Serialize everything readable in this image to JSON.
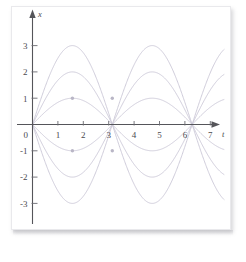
{
  "figure": {
    "background_color": "#ffffff",
    "plate_color": "#ffffff",
    "axis_color": "#55555a",
    "curve_color": "#c9c6d6",
    "marker_color": "#b9b6c6"
  },
  "chart_data": {
    "type": "line",
    "title": "",
    "subtitle": "",
    "xlabel": "t",
    "ylabel": "x",
    "xlim": [
      -0.55,
      7.8
    ],
    "ylim": [
      -3.9,
      3.9
    ],
    "grid": false,
    "legend": "none",
    "x_ticks": [
      0,
      1,
      2,
      3,
      4,
      5,
      6,
      7
    ],
    "x_tick_labels": [
      "0",
      "1",
      "2",
      "3",
      "4",
      "5",
      "6",
      "7"
    ],
    "y_ticks": [
      -3,
      -2,
      -1,
      1,
      2,
      3
    ],
    "y_tick_labels": [
      "-3",
      "-2",
      "-1",
      "1",
      "2",
      "3"
    ],
    "function_form": "x = A sin(t)",
    "period": 6.2832,
    "series": [
      {
        "name": "A = 3",
        "amplitude": 3,
        "values_at_peaks": [
          3,
          -3
        ]
      },
      {
        "name": "A = 2",
        "amplitude": 2,
        "values_at_peaks": [
          2,
          -2
        ]
      },
      {
        "name": "A = 1",
        "amplitude": 1,
        "values_at_peaks": [
          1,
          -1
        ]
      },
      {
        "name": "A = -1",
        "amplitude": -1,
        "values_at_peaks": [
          -1,
          1
        ]
      },
      {
        "name": "A = -2",
        "amplitude": -2,
        "values_at_peaks": [
          -2,
          2
        ]
      },
      {
        "name": "A = -3",
        "amplitude": -3,
        "values_at_peaks": [
          -3,
          3
        ]
      }
    ],
    "markers": [
      {
        "t": 1.5708,
        "x": 1
      },
      {
        "t": 1.5708,
        "x": -1
      },
      {
        "t": 3.1416,
        "x": 1
      },
      {
        "t": 3.1416,
        "x": -1
      }
    ],
    "annotations": []
  },
  "axis_labels": {
    "x_axis_name": "t",
    "y_axis_name": "x"
  }
}
